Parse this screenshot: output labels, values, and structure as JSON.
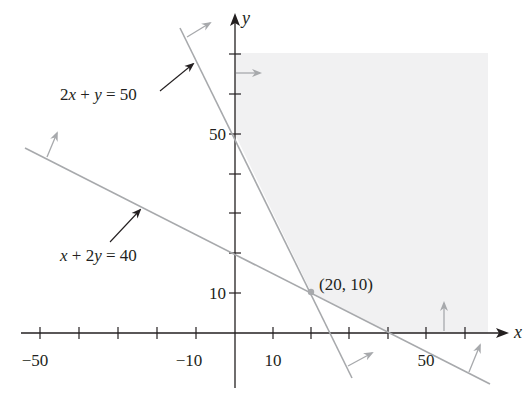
{
  "figure": {
    "type": "linear-programming-feasible-region",
    "colors": {
      "axis": "#231f20",
      "constraint_line": "#a7a9ac",
      "direction_arrow": "#a7a9ac",
      "shaded_region": "#f1f1f2",
      "label_arrow": "#231f20",
      "vertex_point": "#a7a9ac"
    },
    "axes": {
      "x_label": "x",
      "y_label": "y",
      "x_ticks": [
        -50,
        -40,
        -30,
        -20,
        -10,
        10,
        20,
        30,
        40,
        50,
        60
      ],
      "y_ticks": [
        10,
        20,
        30,
        40,
        50,
        60,
        70
      ],
      "x_tick_labels": [
        {
          "value": -50,
          "text": "−50"
        },
        {
          "value": -10,
          "text": "−10"
        },
        {
          "value": 10,
          "text": "10"
        },
        {
          "value": 50,
          "text": "50"
        }
      ],
      "y_tick_labels": [
        {
          "value": 10,
          "text": "10"
        },
        {
          "value": 50,
          "text": "50"
        }
      ]
    },
    "constraints": [
      {
        "name": "line-2x-plus-y",
        "equation": "2x + y = 50",
        "label_parts": [
          "2",
          "x",
          " + ",
          "y",
          " = 50"
        ],
        "inequality": "2x + y ≥ 50",
        "y_intercept": 50,
        "x_intercept": 25
      },
      {
        "name": "line-x-plus-2y",
        "equation": "x + 2y = 40",
        "label_parts": [
          "x",
          " + 2",
          "y",
          " = 40"
        ],
        "inequality": "x + 2y ≥ 40",
        "y_intercept": 20,
        "x_intercept": 40
      }
    ],
    "vertex": {
      "x": 20,
      "y": 10,
      "label": "(20, 10)"
    },
    "feasible_region": "2x + y ≥ 50, x + 2y ≥ 40, x ≥ 0, y ≥ 0 (shaded, unbounded)"
  }
}
